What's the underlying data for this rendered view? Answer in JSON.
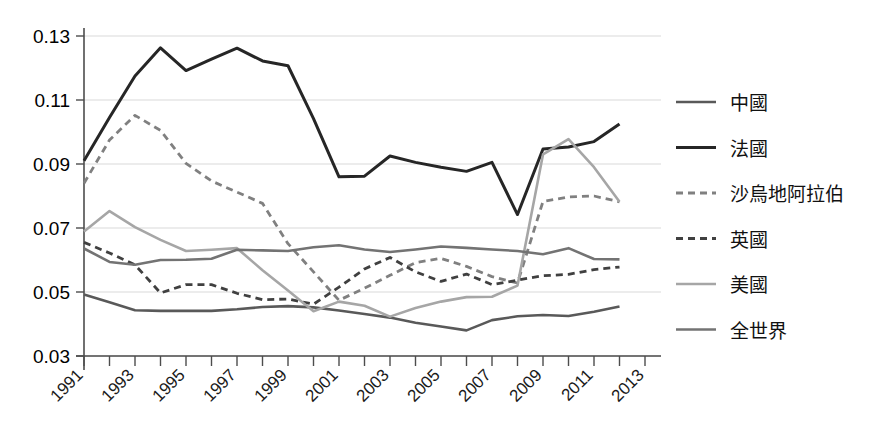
{
  "chart_data": {
    "type": "line",
    "title": "",
    "subtitle": "",
    "xlabel": "",
    "ylabel": "",
    "grid": true,
    "legend_position": "right",
    "xlim": [
      1991,
      2013
    ],
    "ylim": [
      0.03,
      0.13
    ],
    "yticks": [
      "0.03",
      "0.05",
      "0.07",
      "0.09",
      "0.11",
      "0.13"
    ],
    "ytick_values": [
      0.03,
      0.05,
      0.07,
      0.09,
      0.11,
      0.13
    ],
    "xticks": [
      "1991",
      "1993",
      "1995",
      "1997",
      "1999",
      "2001",
      "2003",
      "2005",
      "2007",
      "2009",
      "2011",
      "2013"
    ],
    "xtick_values": [
      1991,
      1993,
      1995,
      1997,
      1999,
      2001,
      2003,
      2005,
      2007,
      2009,
      2011,
      2013
    ],
    "x": [
      1991,
      1992,
      1993,
      1994,
      1995,
      1996,
      1997,
      1998,
      1999,
      2000,
      2001,
      2002,
      2003,
      2004,
      2005,
      2006,
      2007,
      2008,
      2009,
      2010,
      2011,
      2012
    ],
    "series": [
      {
        "name": "中國",
        "color": "#595959",
        "style": "solid",
        "width": 2.6,
        "values": [
          0.0492,
          0.0468,
          0.0443,
          0.0441,
          0.0441,
          0.0441,
          0.0446,
          0.0453,
          0.0456,
          0.0452,
          0.0442,
          0.0431,
          0.042,
          0.0404,
          0.0392,
          0.038,
          0.0412,
          0.0424,
          0.0428,
          0.0425,
          0.0438,
          0.0455
        ]
      },
      {
        "name": "法國",
        "color": "#262626",
        "style": "solid",
        "width": 3.0,
        "values": [
          0.091,
          0.1045,
          0.1175,
          0.1263,
          0.1192,
          0.1228,
          0.1262,
          0.1222,
          0.1207,
          0.1042,
          0.086,
          0.0862,
          0.0925,
          0.0905,
          0.089,
          0.0877,
          0.0905,
          0.0742,
          0.0947,
          0.0953,
          0.097,
          0.1025
        ]
      },
      {
        "name": "沙烏地阿拉伯",
        "color": "#808080",
        "style": "dashed",
        "width": 2.8,
        "values": [
          0.084,
          0.0975,
          0.1052,
          0.1005,
          0.0902,
          0.0847,
          0.0812,
          0.0777,
          0.0651,
          0.0563,
          0.0474,
          0.0512,
          0.0552,
          0.0592,
          0.0605,
          0.058,
          0.0548,
          0.0528,
          0.0783,
          0.0797,
          0.08,
          0.0782
        ]
      },
      {
        "name": "英國",
        "color": "#404040",
        "style": "dashed",
        "width": 2.8,
        "values": [
          0.0655,
          0.0622,
          0.0585,
          0.0497,
          0.0523,
          0.0523,
          0.0496,
          0.0476,
          0.0478,
          0.0462,
          0.0515,
          0.0572,
          0.0608,
          0.0563,
          0.0533,
          0.0556,
          0.0523,
          0.0537,
          0.0551,
          0.0555,
          0.057,
          0.0578
        ]
      },
      {
        "name": "美國",
        "color": "#a6a6a6",
        "style": "solid",
        "width": 2.6,
        "values": [
          0.0689,
          0.0753,
          0.0703,
          0.0663,
          0.0628,
          0.0632,
          0.0637,
          0.0568,
          0.0505,
          0.044,
          0.047,
          0.0457,
          0.0423,
          0.045,
          0.047,
          0.0484,
          0.0485,
          0.052,
          0.093,
          0.0978,
          0.089,
          0.0782
        ]
      },
      {
        "name": "全世界",
        "color": "#737373",
        "style": "solid",
        "width": 2.6,
        "values": [
          0.0636,
          0.0594,
          0.0585,
          0.06,
          0.0601,
          0.0604,
          0.0632,
          0.063,
          0.0628,
          0.064,
          0.0646,
          0.0633,
          0.0625,
          0.0633,
          0.0642,
          0.0638,
          0.0633,
          0.0628,
          0.0618,
          0.0637,
          0.0603,
          0.0602
        ]
      }
    ]
  },
  "legend": {
    "items": [
      {
        "label": "中國"
      },
      {
        "label": "法國"
      },
      {
        "label": "沙烏地阿拉伯"
      },
      {
        "label": "英國"
      },
      {
        "label": "美國"
      },
      {
        "label": "全世界"
      }
    ]
  }
}
